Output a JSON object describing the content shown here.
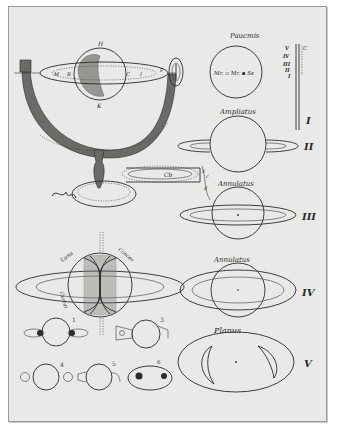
{
  "plate": {
    "background": "#e9e9e7",
    "ink": "#2a2a2a",
    "frame": "#9a9a9a"
  },
  "armillary": {
    "labels": {
      "top": "H",
      "bottom": "K",
      "left": "M",
      "left_inner": "B",
      "right_inner": "C",
      "right_far": "I",
      "ring_end": "F"
    }
  },
  "figures": [
    {
      "id": "I",
      "numeral": "I",
      "title": "Paucmis",
      "inner_text": "Mr. ▫ Mr. ▪ Ss"
    },
    {
      "id": "II",
      "numeral": "II",
      "title": "Ampliatus"
    },
    {
      "id": "III",
      "numeral": "III",
      "title": "Annulatus"
    },
    {
      "id": "IV",
      "numeral": "IV",
      "title": "Annulatus"
    },
    {
      "id": "V",
      "numeral": "V",
      "title": "Planus"
    }
  ],
  "scale": {
    "labels": [
      "V",
      "IV",
      "III",
      "II",
      "I"
    ],
    "side_mark": "C"
  },
  "side_instrument": {
    "letters": [
      "y",
      "c",
      "d"
    ],
    "glyph": "Cb"
  },
  "lower_left": {
    "ring_words": [
      "Luna",
      "Concav",
      "Curvat"
    ],
    "small_figs": [
      "1",
      "2",
      "3",
      "4",
      "5",
      "6"
    ]
  }
}
